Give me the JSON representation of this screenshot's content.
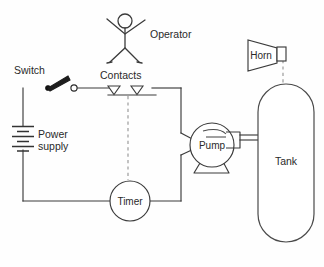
{
  "diagram": {
    "background_color": "#fefefe",
    "line_color": "#3b3b3b",
    "dashed_line_color": "#8d8d8d",
    "text_color": "#2a2a2a",
    "labels": {
      "switch": "Switch",
      "power_supply_line1": "Power",
      "power_supply_line2": "supply",
      "contacts": "Contacts",
      "operator": "Operator",
      "timer": "Timer",
      "pump": "Pump",
      "tank": "Tank",
      "horn": "Horn"
    },
    "components": [
      {
        "name": "switch",
        "kind": "knife-switch",
        "state": "open",
        "label": "Switch"
      },
      {
        "name": "power-supply",
        "kind": "battery",
        "label": "Power supply",
        "cells": 3
      },
      {
        "name": "contacts",
        "kind": "relay-contacts",
        "label": "Contacts",
        "count": 2
      },
      {
        "name": "timer",
        "kind": "circle-component",
        "label": "Timer"
      },
      {
        "name": "pump",
        "kind": "centrifugal-pump",
        "label": "Pump"
      },
      {
        "name": "tank",
        "kind": "vertical-capsule-vessel",
        "label": "Tank"
      },
      {
        "name": "horn",
        "kind": "alarm-horn",
        "label": "Horn"
      },
      {
        "name": "operator",
        "kind": "stick-figure",
        "label": "Operator"
      }
    ],
    "connections": [
      {
        "from": "power-supply",
        "to": "switch",
        "style": "solid"
      },
      {
        "from": "switch",
        "to": "contacts",
        "style": "solid"
      },
      {
        "from": "contacts",
        "to": "pump",
        "style": "solid"
      },
      {
        "from": "pump",
        "to": "timer",
        "style": "solid"
      },
      {
        "from": "timer",
        "to": "power-supply",
        "style": "solid"
      },
      {
        "from": "contacts",
        "to": "timer",
        "style": "dashed"
      },
      {
        "from": "horn",
        "to": "tank",
        "style": "dashed"
      },
      {
        "from": "pump",
        "to": "tank",
        "style": "pipe"
      }
    ]
  }
}
